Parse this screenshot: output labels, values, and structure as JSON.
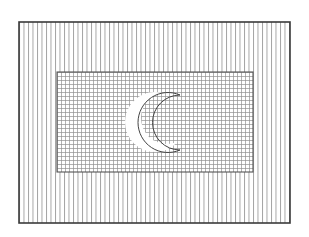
{
  "figure": {
    "colors": {
      "background": "#ffffff",
      "border": "#3a3a3a",
      "hatch": "#8a8a8a",
      "grid": "#909090",
      "crescent_fill": "#ffffff"
    },
    "outer_field": {
      "x": 19,
      "y": 22,
      "width": 271,
      "height": 201,
      "pattern": "vertical-lines",
      "line_spacing": 4.5
    },
    "inner_panel": {
      "x": 57,
      "y": 72,
      "width": 196,
      "height": 100,
      "pattern": "grid",
      "grid_spacing": 4
    },
    "crescent": {
      "cx": 155,
      "cy": 122,
      "outer_r": 30,
      "inner_offset_x": 11,
      "inner_r": 26,
      "orientation": "opens-right"
    }
  }
}
